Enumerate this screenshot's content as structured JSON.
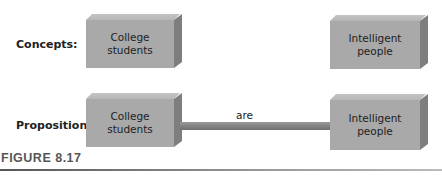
{
  "rows": {
    "concepts": {
      "label": "Concepts:",
      "left_box": "College students",
      "right_box": "Intelligent people"
    },
    "proposition": {
      "label": "Proposition:",
      "left_box": "College students",
      "link_label": "are",
      "right_box": "Intelligent people"
    }
  },
  "figure": {
    "caption": "FIGURE 8.17"
  },
  "colors": {
    "box_front": "#a9a9a9",
    "box_side": "#7e7e7e",
    "link_bar": "#858585"
  }
}
